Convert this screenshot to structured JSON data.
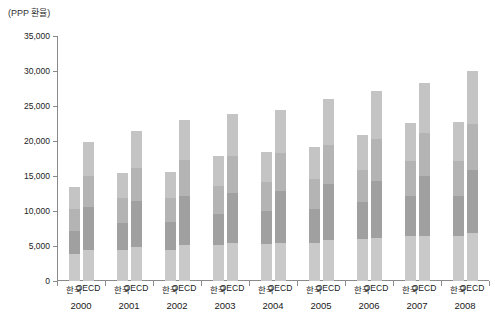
{
  "unit_label": "(PPP 환율)",
  "chart_data": {
    "type": "bar",
    "subtype": "grouped-stacked",
    "title": "",
    "subtitle": "",
    "unit_note": "(PPP 환율)",
    "xlabel": "",
    "ylabel": "",
    "ylim": [
      0,
      35000
    ],
    "ytick_values": [
      0,
      5000,
      10000,
      15000,
      20000,
      25000,
      30000,
      35000
    ],
    "ytick_labels": [
      "0",
      "5,000",
      "10,000",
      "15,000",
      "20,000",
      "25,000",
      "30,000",
      "35,000"
    ],
    "grid": false,
    "legend": "none",
    "categories": [
      "2000",
      "2001",
      "2002",
      "2003",
      "2004",
      "2005",
      "2006",
      "2007",
      "2008"
    ],
    "group_labels": [
      "한국",
      "OECD"
    ],
    "stack_colors": [
      "#c9c9c9",
      "#a0a0a0",
      "#b4b4b4",
      "#c4c4c4"
    ],
    "groups": [
      {
        "year": "2000",
        "bars": [
          {
            "label": "한국",
            "total": 13500,
            "segments": [
              3900,
              3300,
              3100,
              3200
            ]
          },
          {
            "label": "OECD",
            "total": 19900,
            "segments": [
              4500,
              6100,
              4400,
              4900
            ]
          }
        ]
      },
      {
        "year": "2001",
        "bars": [
          {
            "label": "한국",
            "total": 15500,
            "segments": [
              4400,
              3900,
              3500,
              3700
            ]
          },
          {
            "label": "OECD",
            "total": 21500,
            "segments": [
              4900,
              6600,
              4700,
              5300
            ]
          }
        ]
      },
      {
        "year": "2002",
        "bars": [
          {
            "label": "한국",
            "total": 15600,
            "segments": [
              4500,
              3900,
              3500,
              3700
            ]
          },
          {
            "label": "OECD",
            "total": 23000,
            "segments": [
              5200,
              7000,
              5100,
              5700
            ]
          }
        ]
      },
      {
        "year": "2003",
        "bars": [
          {
            "label": "한국",
            "total": 17900,
            "segments": [
              5100,
              4500,
              4000,
              4300
            ]
          },
          {
            "label": "OECD",
            "total": 23800,
            "segments": [
              5400,
              7200,
              5200,
              6000
            ]
          }
        ]
      },
      {
        "year": "2004",
        "bars": [
          {
            "label": "한국",
            "total": 18500,
            "segments": [
              5300,
              4700,
              4100,
              4400
            ]
          },
          {
            "label": "OECD",
            "total": 24400,
            "segments": [
              5500,
              7400,
              5400,
              6100
            ]
          }
        ]
      },
      {
        "year": "2005",
        "bars": [
          {
            "label": "한국",
            "total": 19200,
            "segments": [
              5500,
              4800,
              4300,
              4600
            ]
          },
          {
            "label": "OECD",
            "total": 26000,
            "segments": [
              5900,
              7900,
              5700,
              6500
            ]
          }
        ]
      },
      {
        "year": "2006",
        "bars": [
          {
            "label": "한국",
            "total": 20900,
            "segments": [
              6000,
              5300,
              4600,
              5000
            ]
          },
          {
            "label": "OECD",
            "total": 27100,
            "segments": [
              6100,
              8200,
              6000,
              6800
            ]
          }
        ]
      },
      {
        "year": "2007",
        "bars": [
          {
            "label": "한국",
            "total": 22600,
            "segments": [
              6400,
              5700,
              5000,
              5500
            ]
          },
          {
            "label": "OECD",
            "total": 28300,
            "segments": [
              6400,
              8600,
              6200,
              7100
            ]
          }
        ]
      },
      {
        "year": "2008",
        "bars": [
          {
            "label": "한국",
            "total": 22700,
            "segments": [
              6500,
              5700,
              5000,
              5500
            ]
          },
          {
            "label": "OECD",
            "total": 30000,
            "segments": [
              6800,
              9100,
              6600,
              7500
            ]
          }
        ]
      }
    ]
  }
}
